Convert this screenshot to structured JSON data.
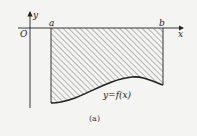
{
  "diagram": {
    "axes": {
      "x_label": "x",
      "y_label": "y",
      "origin_label": "O"
    },
    "bounds": {
      "left_label": "a",
      "right_label": "b"
    },
    "curve_label": "y=f(x)",
    "caption": "(a)",
    "region": "shaded area between x-axis and curve y=f(x) (below x-axis) from x=a to x=b",
    "colors": {
      "stroke": "#222222",
      "hatch": "#555555",
      "background": "#f4f4f2"
    }
  }
}
